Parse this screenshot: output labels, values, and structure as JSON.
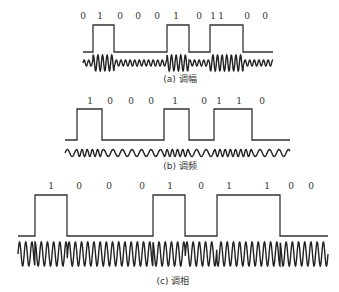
{
  "panels": [
    {
      "id": "am",
      "caption": "(a) 调幅",
      "bits": [
        "0",
        "1",
        "0",
        "0",
        "0",
        "1",
        "0",
        "1",
        "1",
        "0",
        "0"
      ],
      "digit_x": [
        83,
        100,
        120,
        138,
        157,
        176,
        199,
        213,
        221,
        247,
        265
      ],
      "digit_y": 19,
      "square": {
        "x0": 83,
        "x1": 273,
        "low_y": 52,
        "high_y": 25,
        "pulses": [
          [
            93,
            114
          ],
          [
            167,
            189
          ],
          [
            210,
            243
          ]
        ]
      },
      "wave": {
        "type": "am",
        "x0": 83,
        "x1": 273,
        "cy": 63,
        "period": 4.6,
        "amp_high": 8,
        "amp_low": 3
      },
      "caption_x": 180,
      "caption_y": 82
    },
    {
      "id": "fm",
      "caption": "(b) 调频",
      "bits": [
        "1",
        "0",
        "0",
        "0",
        "1",
        "0",
        "1",
        "1",
        "0"
      ],
      "digit_x": [
        90,
        110,
        131,
        151,
        175,
        204,
        219,
        239,
        262
      ],
      "digit_y": 104,
      "square": {
        "x0": 65,
        "x1": 290,
        "low_y": 140,
        "high_y": 109,
        "pulses": [
          [
            77,
            102
          ],
          [
            164,
            189
          ],
          [
            214,
            252
          ]
        ]
      },
      "wave": {
        "type": "fm",
        "x0": 65,
        "x1": 290,
        "cy": 153,
        "period_high": 5.2,
        "period_low": 9.5,
        "amp": 3.5
      },
      "caption_x": 180,
      "caption_y": 169
    },
    {
      "id": "pm",
      "caption": "(c) 调相",
      "bits": [
        "1",
        "0",
        "0",
        "0",
        "1",
        "0",
        "1",
        "1",
        "0",
        "0"
      ],
      "digit_x": [
        51,
        79,
        109,
        142,
        170,
        201,
        229,
        267,
        291,
        311
      ],
      "digit_y": 189,
      "square": {
        "x0": 18,
        "x1": 328,
        "low_y": 236,
        "high_y": 195,
        "pulses": [
          [
            35,
            67
          ],
          [
            153,
            185
          ],
          [
            217,
            280
          ]
        ]
      },
      "wave": {
        "type": "pm",
        "x0": 18,
        "x1": 328,
        "cy": 254,
        "period": 6.2,
        "amp": 12
      },
      "caption_x": 173,
      "caption_y": 284
    }
  ]
}
